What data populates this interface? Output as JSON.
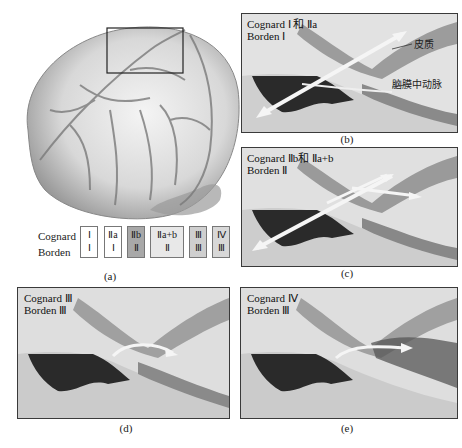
{
  "figure": {
    "panel_a": {
      "caption": "(a)",
      "legend": {
        "row_labels": [
          "Cognard",
          "Borden"
        ],
        "columns": [
          {
            "cognard": "Ⅰ",
            "borden": "Ⅰ",
            "fill": "#ffffff"
          },
          {
            "cognard": "Ⅱa",
            "borden": "Ⅰ",
            "fill": "#ffffff"
          },
          {
            "cognard": "Ⅱb",
            "borden": "Ⅱ",
            "fill": "#a8a8a8"
          },
          {
            "cognard": "Ⅱa+b",
            "borden": "Ⅱ",
            "fill": "#e8e8e8"
          },
          {
            "cognard": "Ⅲ",
            "borden": "Ⅲ",
            "fill": "#cfcfcf"
          },
          {
            "cognard": "Ⅳ",
            "borden": "Ⅲ",
            "fill": "#d8d8d8"
          }
        ]
      }
    },
    "panel_b": {
      "caption": "(b)",
      "title_line1": "Cognard Ⅰ 和 Ⅱa",
      "title_line2": "Borden Ⅰ",
      "annotations": [
        "皮质",
        "脑膜中动脉"
      ]
    },
    "panel_c": {
      "caption": "(c)",
      "title_line1": "Cognard Ⅱb和 Ⅱa+b",
      "title_line2": "Borden Ⅱ"
    },
    "panel_d": {
      "caption": "(d)",
      "title_line1": "Cognard Ⅲ",
      "title_line2": "Borden Ⅲ"
    },
    "panel_e": {
      "caption": "(e)",
      "title_line1": "Cognard Ⅳ",
      "title_line2": "Borden Ⅲ"
    }
  }
}
